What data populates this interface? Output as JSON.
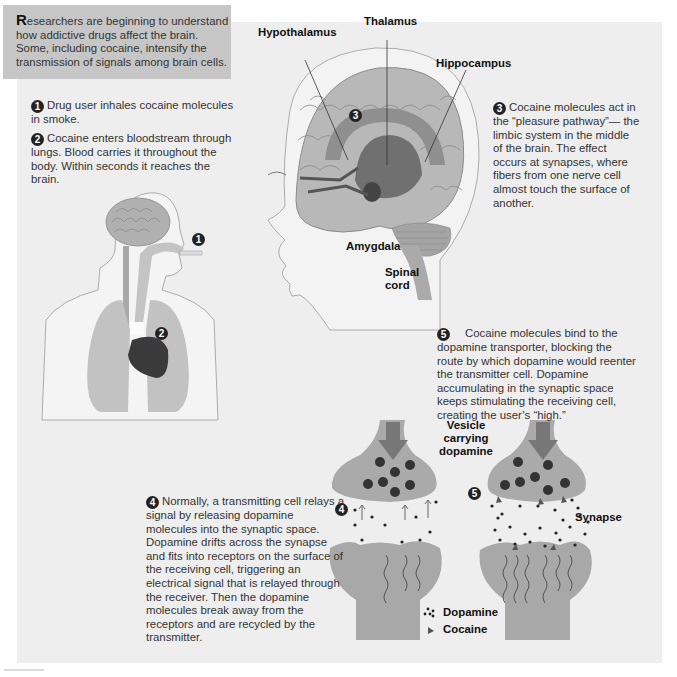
{
  "intro": {
    "dropcap": "R",
    "text": "esearchers are beginning to understand how addictive drugs affect the brain. Some, including cocaine, intensify the transmission of signals among brain cells."
  },
  "steps": [
    {
      "number": "1",
      "text": "Drug user inhales cocaine molecules in smoke."
    },
    {
      "number": "2",
      "text": "Cocaine enters bloodstream through lungs. Blood carries it throughout the body. Within seconds it reaches the brain."
    },
    {
      "number": "3",
      "text": "Cocaine molecules act in the “pleasure pathway”— the limbic system in the middle of the brain. The effect occurs at synapses, where fibers from one nerve cell almost touch the surface of another."
    },
    {
      "number": "4",
      "text": "Normally, a transmitting cell relays a signal by releasing dopamine molecules into the synaptic space. Dopamine drifts across the synapse and fits into receptors on the surface of the receiving cell, triggering an electrical signal that is relayed through the receiver. Then the dopamine molecules break away from the receptors and are recycled by the transmitter."
    },
    {
      "number": "5",
      "text": "Cocaine molecules bind to the dopamine transporter, blocking the route by which dopamine would reenter the transmitter cell. Dopamine accumulating in the synaptic space keeps stimulating the receiving cell, creating the user’s “high.”"
    }
  ],
  "brain_labels": {
    "hypothalamus": "Hypothalamus",
    "thalamus": "Thalamus",
    "hippocampus": "Hippocampus",
    "amygdala": "Amygdala",
    "spinal_cord_line1": "Spinal",
    "spinal_cord_line2": "cord"
  },
  "synapse_labels": {
    "vesicle_line1": "Vesicle",
    "vesicle_line2": "carrying",
    "vesicle_line3": "dopamine",
    "synapse": "Synapse"
  },
  "markers": {
    "body_1": "1",
    "body_2": "2",
    "brain_3": "3",
    "synapse_4": "4",
    "synapse_5": "5"
  },
  "legend": [
    {
      "icon": "dopamine-dots-icon",
      "label": "Dopamine"
    },
    {
      "icon": "cocaine-triangle-icon",
      "label": "Cocaine"
    }
  ],
  "colors": {
    "background": "#ffffff",
    "panel": "#eeeeee",
    "intro_box": "#c6c6c6",
    "tissue": "#9c9c9c",
    "dark": "#222222"
  }
}
